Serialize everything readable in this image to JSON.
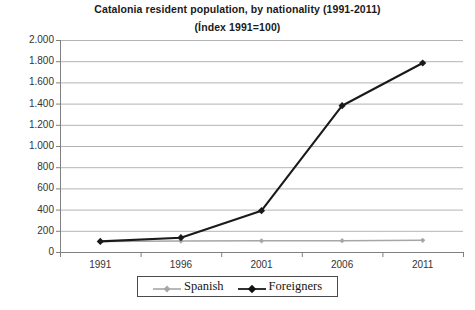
{
  "chart_data": {
    "type": "line",
    "title": "Catalonia resident population, by nationality (1991-2011)",
    "subtitle": "(Índex 1991=100)",
    "xlabel": "",
    "ylabel": "",
    "categories": [
      "1991",
      "1996",
      "2001",
      "2006",
      "2011"
    ],
    "series": [
      {
        "name": "Spanish",
        "color": "#a6a6a6",
        "marker": "diamond",
        "values": [
          100,
          103,
          105,
          107,
          110
        ]
      },
      {
        "name": "Foreigners",
        "color": "#1a1a1a",
        "marker": "diamond",
        "values": [
          100,
          135,
          390,
          1380,
          1783
        ]
      }
    ],
    "ylim": [
      0,
      2000
    ],
    "ytick_step": 200,
    "ytick_labels": [
      "2.000",
      "1.800",
      "1.600",
      "1.400",
      "1.200",
      "1.000",
      "800",
      "600",
      "400",
      "200",
      "0"
    ],
    "ytick_values": [
      2000,
      1800,
      1600,
      1400,
      1200,
      1000,
      800,
      600,
      400,
      200,
      0
    ],
    "grid": true,
    "grid_axis": "y",
    "legend_position": "bottom"
  },
  "legend": {
    "entries": [
      {
        "label": "Spanish",
        "color": "#a6a6a6"
      },
      {
        "label": "Foreigners",
        "color": "#1a1a1a"
      }
    ]
  },
  "colors": {
    "spanish": "#a6a6a6",
    "foreigners": "#1a1a1a",
    "grid": "#b4b4b4",
    "axis": "#808080",
    "text": "#333333",
    "title": "#1a1a1a",
    "background": "#ffffff"
  }
}
